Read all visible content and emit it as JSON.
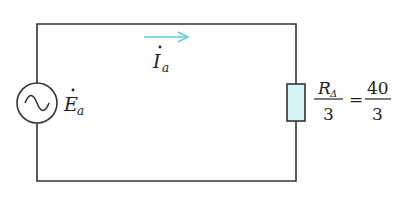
{
  "diagram": {
    "type": "ac-circuit-equivalent",
    "source": {
      "symbol": "E",
      "subscript": "a",
      "phasor_dot": true,
      "label_full": "Ė_a",
      "icon": "ac-voltage-source-icon"
    },
    "current": {
      "symbol": "I",
      "subscript": "a",
      "phasor_dot": true,
      "label_full": "İ_a",
      "direction": "right",
      "arrow_color": "#5fd0d8"
    },
    "load": {
      "icon": "resistor-icon",
      "fill_color": "#d8f4f8",
      "equation": {
        "lhs_numerator_symbol": "R",
        "lhs_numerator_subscript": "Δ",
        "lhs_denominator": "3",
        "equals": "=",
        "rhs_numerator": "40",
        "rhs_denominator": "3"
      }
    },
    "colors": {
      "wire": "#333333",
      "text": "#222222"
    }
  }
}
